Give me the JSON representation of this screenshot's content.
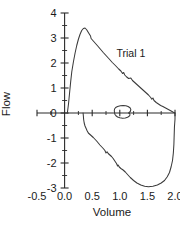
{
  "chart_data": {
    "type": "line",
    "title": "",
    "xlabel": "Volume",
    "ylabel": "Flow",
    "xlim": [
      -0.5,
      2.0
    ],
    "ylim": [
      -3,
      4
    ],
    "grid": false,
    "legend": "none",
    "annotations": [
      {
        "text": "Trial 1",
        "x": 1.2,
        "y": 2.25
      }
    ],
    "xticks": [
      -0.5,
      0.0,
      0.5,
      1.0,
      1.5,
      2.0
    ],
    "xtick_labels": [
      "-0.5",
      "0.0",
      "0.5",
      "1.0",
      "1.5",
      "2.0"
    ],
    "yticks": [
      -3,
      -2,
      -1,
      0,
      1,
      2,
      3,
      4
    ],
    "ytick_labels": [
      "-3",
      "-2",
      "-1",
      "0",
      "1",
      "2",
      "3",
      "4"
    ],
    "xminor_step": 0.25,
    "yminor_step": 0.5,
    "series": [
      {
        "name": "Forced expiratory limb",
        "points": [
          [
            0.05,
            0.0
          ],
          [
            0.07,
            0.35
          ],
          [
            0.09,
            0.8
          ],
          [
            0.11,
            1.25
          ],
          [
            0.13,
            1.65
          ],
          [
            0.16,
            2.05
          ],
          [
            0.19,
            2.4
          ],
          [
            0.22,
            2.7
          ],
          [
            0.25,
            2.95
          ],
          [
            0.28,
            3.15
          ],
          [
            0.31,
            3.3
          ],
          [
            0.34,
            3.38
          ],
          [
            0.37,
            3.4
          ],
          [
            0.4,
            3.33
          ],
          [
            0.43,
            3.22
          ],
          [
            0.45,
            3.15
          ],
          [
            0.47,
            3.08
          ],
          [
            0.48,
            2.98
          ],
          [
            0.52,
            2.88
          ],
          [
            0.56,
            2.78
          ],
          [
            0.6,
            2.68
          ],
          [
            0.65,
            2.55
          ],
          [
            0.7,
            2.42
          ],
          [
            0.75,
            2.3
          ],
          [
            0.8,
            2.18
          ],
          [
            0.86,
            2.03
          ],
          [
            0.92,
            1.9
          ],
          [
            0.98,
            1.76
          ],
          [
            1.02,
            1.68
          ],
          [
            1.05,
            1.58
          ],
          [
            1.07,
            1.62
          ],
          [
            1.09,
            1.52
          ],
          [
            1.12,
            1.45
          ],
          [
            1.16,
            1.38
          ],
          [
            1.2,
            1.4
          ],
          [
            1.23,
            1.3
          ],
          [
            1.27,
            1.22
          ],
          [
            1.32,
            1.12
          ],
          [
            1.37,
            1.02
          ],
          [
            1.42,
            0.92
          ],
          [
            1.47,
            0.82
          ],
          [
            1.52,
            0.72
          ],
          [
            1.56,
            0.62
          ],
          [
            1.58,
            0.55
          ],
          [
            1.6,
            0.6
          ],
          [
            1.62,
            0.5
          ],
          [
            1.66,
            0.42
          ],
          [
            1.7,
            0.36
          ],
          [
            1.74,
            0.3
          ],
          [
            1.78,
            0.26
          ],
          [
            1.83,
            0.2
          ],
          [
            1.88,
            0.14
          ],
          [
            1.93,
            0.08
          ],
          [
            1.97,
            0.03
          ],
          [
            2.0,
            0.0
          ]
        ]
      },
      {
        "name": "Inspiratory limb",
        "points": [
          [
            2.0,
            0.0
          ],
          [
            2.0,
            -0.25
          ],
          [
            1.99,
            -0.55
          ],
          [
            1.985,
            -0.9
          ],
          [
            1.98,
            -1.25
          ],
          [
            1.97,
            -1.6
          ],
          [
            1.955,
            -1.9
          ],
          [
            1.93,
            -2.15
          ],
          [
            1.9,
            -2.38
          ],
          [
            1.86,
            -2.55
          ],
          [
            1.81,
            -2.7
          ],
          [
            1.75,
            -2.8
          ],
          [
            1.68,
            -2.88
          ],
          [
            1.6,
            -2.93
          ],
          [
            1.52,
            -2.95
          ],
          [
            1.45,
            -2.93
          ],
          [
            1.38,
            -2.88
          ],
          [
            1.31,
            -2.8
          ],
          [
            1.25,
            -2.7
          ],
          [
            1.19,
            -2.58
          ],
          [
            1.14,
            -2.46
          ],
          [
            1.1,
            -2.36
          ],
          [
            1.06,
            -2.28
          ],
          [
            1.02,
            -2.22
          ],
          [
            0.99,
            -2.16
          ],
          [
            0.97,
            -2.08
          ],
          [
            0.96,
            -2.12
          ],
          [
            0.94,
            -2.02
          ],
          [
            0.91,
            -1.92
          ],
          [
            0.88,
            -1.82
          ],
          [
            0.85,
            -1.74
          ],
          [
            0.82,
            -1.68
          ],
          [
            0.79,
            -1.62
          ],
          [
            0.77,
            -1.55
          ],
          [
            0.75,
            -1.6
          ],
          [
            0.73,
            -1.5
          ],
          [
            0.7,
            -1.42
          ],
          [
            0.67,
            -1.35
          ],
          [
            0.64,
            -1.28
          ],
          [
            0.61,
            -1.2
          ],
          [
            0.58,
            -1.12
          ],
          [
            0.55,
            -1.05
          ],
          [
            0.52,
            -0.98
          ],
          [
            0.49,
            -0.92
          ],
          [
            0.46,
            -0.86
          ],
          [
            0.43,
            -0.8
          ],
          [
            0.41,
            -0.72
          ],
          [
            0.39,
            -0.62
          ],
          [
            0.37,
            -0.52
          ],
          [
            0.355,
            -0.4
          ],
          [
            0.345,
            -0.26
          ],
          [
            0.34,
            -0.12
          ],
          [
            0.335,
            0.0
          ]
        ]
      },
      {
        "name": "Tidal breathing loop",
        "points": [
          [
            1.16,
            0.0
          ],
          [
            1.19,
            0.06
          ],
          [
            1.2,
            0.14
          ],
          [
            1.185,
            0.21
          ],
          [
            1.15,
            0.26
          ],
          [
            1.11,
            0.29
          ],
          [
            1.06,
            0.3
          ],
          [
            1.01,
            0.29
          ],
          [
            0.96,
            0.26
          ],
          [
            0.925,
            0.22
          ],
          [
            0.905,
            0.16
          ],
          [
            0.9,
            0.09
          ],
          [
            0.905,
            0.02
          ],
          [
            0.91,
            -0.05
          ],
          [
            0.93,
            -0.11
          ],
          [
            0.96,
            -0.16
          ],
          [
            1.0,
            -0.19
          ],
          [
            1.05,
            -0.21
          ],
          [
            1.1,
            -0.2
          ],
          [
            1.14,
            -0.17
          ],
          [
            1.17,
            -0.13
          ],
          [
            1.185,
            -0.08
          ],
          [
            1.18,
            -0.03
          ],
          [
            1.16,
            0.0
          ]
        ]
      }
    ]
  },
  "axis": {
    "ylabel_text": "Flow",
    "xlabel_text": "Volume"
  }
}
